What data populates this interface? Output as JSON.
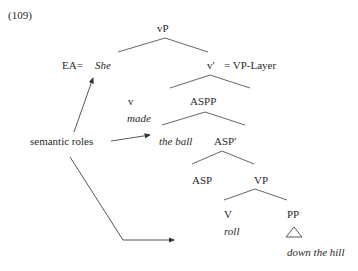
{
  "example_number": "(109)",
  "tree": {
    "root": "vP",
    "specifier_prefix": "EA=",
    "specifier": "She",
    "v_bar": "v'",
    "layer_note": "= VP-Layer",
    "v": "v",
    "v_word": "made",
    "aspp": "ASPP",
    "aspp_spec": "the ball",
    "asp_bar": "ASP'",
    "asp": "ASP",
    "vp": "VP",
    "verb": "V",
    "verb_word": "roll",
    "pp": "PP",
    "pp_phrase": "down the hill"
  },
  "annotation": {
    "label": "semantic roles",
    "arrow_targets": [
      "She",
      "the ball",
      "down the hill"
    ]
  },
  "colors": {
    "ink": "#2a2a2a",
    "line": "#555555"
  }
}
